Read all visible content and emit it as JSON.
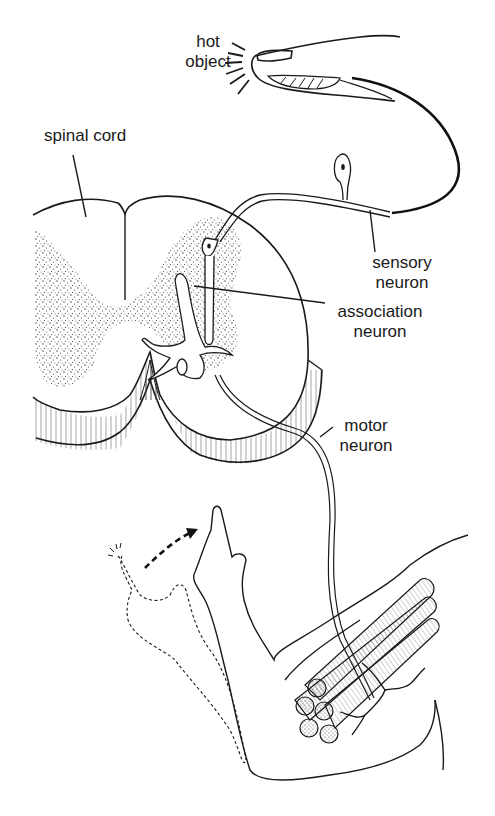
{
  "figure": {
    "background": "#ffffff",
    "ink": "#1a1a1a"
  },
  "labels": {
    "hot_object": {
      "line1": "hot",
      "line2": "object"
    },
    "spinal_cord": "spinal cord",
    "sensory_neuron": {
      "line1": "sensory",
      "line2": "neuron"
    },
    "association_neuron": {
      "line1": "association",
      "line2": "neuron"
    },
    "motor_neuron": {
      "line1": "motor",
      "line2": "neuron"
    }
  },
  "icons": {
    "heat_rays": "heat-radiation-lines",
    "movement_arrow": "dashed-curved-arrow"
  }
}
